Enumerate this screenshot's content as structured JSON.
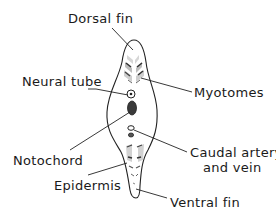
{
  "diagram": {
    "type": "cross-section",
    "labels": {
      "dorsal_fin": "Dorsal fin",
      "neural_tube": "Neural tube",
      "myotomes": "Myotomes",
      "notochord": "Notochord",
      "caudal_vessels_line1": "Caudal artery",
      "caudal_vessels_line2": "and vein",
      "epidermis": "Epidermis",
      "ventral_fin": "Ventral fin"
    },
    "colors": {
      "ink": "#222222",
      "notochord_fill": "#3a3a3a",
      "myotome_shade": "#cfcfcf",
      "background": "#ffffff"
    }
  }
}
